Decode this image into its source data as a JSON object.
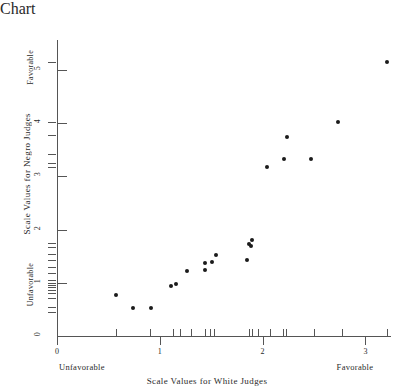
{
  "chart_data": {
    "type": "scatter",
    "title": "",
    "xlabel": "Scale Values for White Judges",
    "ylabel": "Scale Values for Negro Judges",
    "xlim": [
      0,
      3.3
    ],
    "ylim": [
      0,
      5.35
    ],
    "grid": false,
    "legend": null,
    "x_tick_labels": [
      "0",
      "1",
      "2",
      "3"
    ],
    "x_tick_values": [
      0,
      1,
      2,
      3
    ],
    "y_tick_labels": [
      "0",
      "1",
      "2",
      "3",
      "4",
      "5"
    ],
    "y_tick_values": [
      0,
      1,
      2,
      3,
      4,
      5
    ],
    "x_endpoint_low": "Unfavorable",
    "x_endpoint_high": "Favorable",
    "y_endpoint_low": "Unfavorable",
    "y_endpoint_high": "Favorable",
    "x_rug_values": [
      0.57,
      0.9,
      1.13,
      1.2,
      1.3,
      1.44,
      1.49,
      1.53,
      1.87,
      1.9,
      1.96,
      2.07,
      2.2,
      2.23,
      2.5,
      2.77,
      3.21
    ],
    "y_rug_values": [
      0.45,
      0.55,
      0.72,
      0.8,
      0.87,
      0.92,
      0.96,
      1.0,
      1.06,
      1.19,
      1.3,
      1.43,
      1.55,
      1.68,
      1.75,
      3.17,
      3.26,
      3.43,
      3.77,
      4.02,
      5.15
    ],
    "points": [
      {
        "x": 0.57,
        "y": 0.77
      },
      {
        "x": 0.74,
        "y": 0.53
      },
      {
        "x": 0.91,
        "y": 0.53
      },
      {
        "x": 1.11,
        "y": 0.94
      },
      {
        "x": 1.16,
        "y": 0.98
      },
      {
        "x": 1.26,
        "y": 1.23
      },
      {
        "x": 1.44,
        "y": 1.25
      },
      {
        "x": 1.44,
        "y": 1.38
      },
      {
        "x": 1.51,
        "y": 1.4
      },
      {
        "x": 1.55,
        "y": 1.53
      },
      {
        "x": 1.85,
        "y": 1.42
      },
      {
        "x": 1.87,
        "y": 1.72
      },
      {
        "x": 1.89,
        "y": 1.7
      },
      {
        "x": 1.9,
        "y": 1.81
      },
      {
        "x": 2.04,
        "y": 3.17
      },
      {
        "x": 2.21,
        "y": 3.32
      },
      {
        "x": 2.24,
        "y": 3.75
      },
      {
        "x": 2.47,
        "y": 3.32
      },
      {
        "x": 2.73,
        "y": 4.02
      },
      {
        "x": 3.21,
        "y": 5.15
      }
    ]
  }
}
